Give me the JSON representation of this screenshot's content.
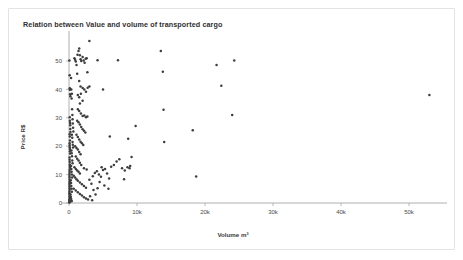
{
  "chart_data": {
    "type": "scatter",
    "title": "Relation between Value and volume of transported cargo",
    "xlabel": "Volume m³",
    "ylabel": "Price R$",
    "xlim": [
      -2000,
      57000
    ],
    "ylim": [
      -2,
      58
    ],
    "grid": false,
    "legend": null,
    "xticks": [
      0,
      10000,
      20000,
      30000,
      40000,
      50000
    ],
    "xtick_labels": [
      "0",
      "10k",
      "20k",
      "30k",
      "40k",
      "50k"
    ],
    "yticks": [
      0,
      10,
      20,
      30,
      40,
      50
    ],
    "ytick_labels": [
      "0",
      "10",
      "20",
      "30",
      "40",
      "50"
    ],
    "marker_color": "#3d3d3d",
    "axis_color": "#a6a6a6",
    "background_color": "#ffffff",
    "border_color": "#e3e3e3",
    "points": [
      [
        60,
        50.2
      ],
      [
        90,
        45.0
      ],
      [
        120,
        40.4
      ],
      [
        140,
        39.9
      ],
      [
        150,
        40.1
      ],
      [
        170,
        38.3
      ],
      [
        200,
        37.6
      ],
      [
        110,
        30.2
      ],
      [
        130,
        29.0
      ],
      [
        160,
        28.2
      ],
      [
        180,
        27.4
      ],
      [
        190,
        26.1
      ],
      [
        210,
        25.0
      ],
      [
        100,
        24.2
      ],
      [
        120,
        23.4
      ],
      [
        140,
        22.0
      ],
      [
        95,
        21.0
      ],
      [
        105,
        20.3
      ],
      [
        115,
        19.6
      ],
      [
        125,
        19.0
      ],
      [
        135,
        18.2
      ],
      [
        150,
        17.4
      ],
      [
        80,
        16.0
      ],
      [
        90,
        15.2
      ],
      [
        100,
        14.4
      ],
      [
        110,
        13.6
      ],
      [
        120,
        13.0
      ],
      [
        130,
        12.4
      ],
      [
        85,
        11.6
      ],
      [
        95,
        10.9
      ],
      [
        70,
        10.2
      ],
      [
        75,
        9.5
      ],
      [
        80,
        8.9
      ],
      [
        88,
        8.2
      ],
      [
        92,
        7.6
      ],
      [
        65,
        7.0
      ],
      [
        70,
        6.4
      ],
      [
        78,
        5.8
      ],
      [
        84,
        5.2
      ],
      [
        90,
        4.6
      ],
      [
        60,
        4.0
      ],
      [
        66,
        3.4
      ],
      [
        72,
        2.9
      ],
      [
        80,
        2.3
      ],
      [
        88,
        1.8
      ],
      [
        55,
        1.2
      ],
      [
        62,
        0.8
      ],
      [
        70,
        0.5
      ],
      [
        78,
        0.3
      ],
      [
        50,
        0.2
      ],
      [
        300,
        44.0
      ],
      [
        340,
        40.0
      ],
      [
        420,
        38.5
      ],
      [
        380,
        36.8
      ],
      [
        450,
        33.0
      ],
      [
        500,
        31.0
      ],
      [
        520,
        29.5
      ],
      [
        560,
        28.0
      ],
      [
        600,
        26.5
      ],
      [
        640,
        25.2
      ],
      [
        420,
        24.0
      ],
      [
        480,
        23.0
      ],
      [
        520,
        21.5
      ],
      [
        560,
        20.5
      ],
      [
        600,
        19.5
      ],
      [
        360,
        18.5
      ],
      [
        400,
        17.5
      ],
      [
        440,
        16.5
      ],
      [
        480,
        15.0
      ],
      [
        520,
        14.0
      ],
      [
        300,
        13.0
      ],
      [
        340,
        12.0
      ],
      [
        380,
        11.0
      ],
      [
        420,
        10.0
      ],
      [
        460,
        9.0
      ],
      [
        260,
        8.0
      ],
      [
        300,
        7.0
      ],
      [
        340,
        6.0
      ],
      [
        380,
        5.0
      ],
      [
        420,
        4.0
      ],
      [
        220,
        3.0
      ],
      [
        260,
        2.2
      ],
      [
        300,
        1.6
      ],
      [
        340,
        1.0
      ],
      [
        380,
        0.6
      ],
      [
        800,
        51.0
      ],
      [
        900,
        50.4
      ],
      [
        1000,
        49.8
      ],
      [
        1100,
        48.6
      ],
      [
        1250,
        52.2
      ],
      [
        1400,
        53.5
      ],
      [
        1500,
        54.4
      ],
      [
        1600,
        52.0
      ],
      [
        1700,
        50.6
      ],
      [
        1800,
        50.0
      ],
      [
        2000,
        51.4
      ],
      [
        2150,
        50.2
      ],
      [
        2300,
        49.4
      ],
      [
        2450,
        50.8
      ],
      [
        2600,
        51.0
      ],
      [
        3000,
        57.0
      ],
      [
        2700,
        46.0
      ],
      [
        1200,
        45.5
      ],
      [
        1500,
        43.0
      ],
      [
        1700,
        41.0
      ],
      [
        2000,
        40.5
      ],
      [
        2250,
        40.0
      ],
      [
        2500,
        39.2
      ],
      [
        2750,
        40.6
      ],
      [
        3000,
        41.0
      ],
      [
        1300,
        38.0
      ],
      [
        1500,
        37.2
      ],
      [
        1750,
        38.5
      ],
      [
        2000,
        36.0
      ],
      [
        1600,
        35.0
      ],
      [
        1300,
        33.0
      ],
      [
        1500,
        32.4
      ],
      [
        1750,
        31.5
      ],
      [
        2000,
        30.6
      ],
      [
        2250,
        30.8
      ],
      [
        2500,
        30.2
      ],
      [
        2700,
        30.5
      ],
      [
        1200,
        29.0
      ],
      [
        1400,
        28.4
      ],
      [
        1600,
        27.6
      ],
      [
        1800,
        26.8
      ],
      [
        2000,
        26.0
      ],
      [
        2200,
        25.4
      ],
      [
        2400,
        24.8
      ],
      [
        1100,
        24.0
      ],
      [
        1300,
        23.2
      ],
      [
        1500,
        22.4
      ],
      [
        1700,
        21.6
      ],
      [
        1900,
        21.0
      ],
      [
        2100,
        20.4
      ],
      [
        900,
        20.0
      ],
      [
        1100,
        19.4
      ],
      [
        1300,
        18.8
      ],
      [
        1500,
        18.0
      ],
      [
        1700,
        17.2
      ],
      [
        1000,
        16.4
      ],
      [
        1200,
        15.6
      ],
      [
        1400,
        15.0
      ],
      [
        1600,
        14.2
      ],
      [
        1800,
        13.4
      ],
      [
        800,
        12.6
      ],
      [
        1000,
        12.0
      ],
      [
        1200,
        11.4
      ],
      [
        1400,
        11.0
      ],
      [
        1600,
        10.4
      ],
      [
        2200,
        12.2
      ],
      [
        2600,
        11.8
      ],
      [
        700,
        9.6
      ],
      [
        900,
        9.0
      ],
      [
        1100,
        8.4
      ],
      [
        1300,
        7.8
      ],
      [
        1600,
        7.2
      ],
      [
        1900,
        6.6
      ],
      [
        2200,
        6.0
      ],
      [
        2500,
        5.4
      ],
      [
        700,
        5.0
      ],
      [
        1000,
        4.4
      ],
      [
        1300,
        3.8
      ],
      [
        1600,
        3.2
      ],
      [
        1900,
        2.6
      ],
      [
        2200,
        2.0
      ],
      [
        2500,
        1.6
      ],
      [
        2800,
        1.2
      ],
      [
        3100,
        2.4
      ],
      [
        3400,
        1.0
      ],
      [
        3600,
        4.6
      ],
      [
        3900,
        3.0
      ],
      [
        4200,
        5.2
      ],
      [
        3300,
        6.8
      ],
      [
        3000,
        8.2
      ],
      [
        3500,
        9.4
      ],
      [
        3800,
        10.6
      ],
      [
        4100,
        11.2
      ],
      [
        4400,
        10.0
      ],
      [
        4700,
        9.2
      ],
      [
        5000,
        11.6
      ],
      [
        5300,
        12.0
      ],
      [
        4800,
        12.6
      ],
      [
        5600,
        10.4
      ],
      [
        5900,
        8.6
      ],
      [
        4500,
        7.4
      ],
      [
        5200,
        6.2
      ],
      [
        5800,
        5.0
      ],
      [
        6200,
        12.8
      ],
      [
        6600,
        13.4
      ],
      [
        7000,
        14.6
      ],
      [
        6000,
        23.4
      ],
      [
        5000,
        40.0
      ],
      [
        4200,
        50.3
      ],
      [
        7200,
        50.3
      ],
      [
        7400,
        15.4
      ],
      [
        7800,
        12.2
      ],
      [
        8200,
        11.4
      ],
      [
        8600,
        12.6
      ],
      [
        8900,
        12.2
      ],
      [
        8100,
        8.4
      ],
      [
        8700,
        22.6
      ],
      [
        9200,
        16.2
      ],
      [
        9800,
        27.1
      ],
      [
        9000,
        13.0
      ],
      [
        13500,
        53.5
      ],
      [
        13800,
        46.2
      ],
      [
        13900,
        32.8
      ],
      [
        14000,
        21.5
      ],
      [
        18200,
        25.6
      ],
      [
        18700,
        9.3
      ],
      [
        21700,
        48.6
      ],
      [
        22400,
        41.3
      ],
      [
        24300,
        50.2
      ],
      [
        24000,
        31.0
      ],
      [
        53000,
        38.0
      ]
    ]
  }
}
